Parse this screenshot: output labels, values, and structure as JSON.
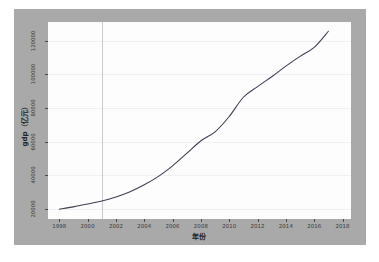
{
  "figure": {
    "background_color": "#a9a9a9",
    "plot_background_color": "#fdfdfd",
    "line_color": "#3d3d52",
    "grid_color": "#f0f0f2",
    "marker_line_color": "#c9c9cf",
    "caption": ""
  },
  "chart_data": {
    "type": "line",
    "title": "",
    "xlabel": "年份",
    "ylabel": "gdp（亿元）",
    "xlim": [
      1997.2,
      2018.6
    ],
    "ylim": [
      14000,
      131000
    ],
    "grid": true,
    "legend": null,
    "xticks": [
      1998,
      2000,
      2002,
      2004,
      2006,
      2008,
      2010,
      2012,
      2014,
      2016,
      2018
    ],
    "yticks": [
      20000,
      40000,
      60000,
      80000,
      100000,
      120000
    ],
    "annotations": [
      {
        "type": "vertical-line",
        "x": 2001,
        "label": ""
      }
    ],
    "x": [
      1998,
      1999,
      2000,
      2001,
      2002,
      2003,
      2004,
      2005,
      2006,
      2007,
      2008,
      2009,
      2010,
      2011,
      2012,
      2013,
      2014,
      2015,
      2016,
      2017
    ],
    "values": [
      19800,
      21200,
      22900,
      24700,
      27100,
      30200,
      34300,
      39300,
      45600,
      53000,
      60500,
      65800,
      74900,
      86300,
      92600,
      98500,
      104800,
      110600,
      115900,
      125500
    ],
    "series": [
      {
        "name": "gdp",
        "values": [
          19800,
          21200,
          22900,
          24700,
          27100,
          30200,
          34300,
          39300,
          45600,
          53000,
          60500,
          65800,
          74900,
          86300,
          92600,
          98500,
          104800,
          110600,
          115900,
          125500
        ]
      }
    ]
  },
  "axes": {
    "x_tick_labels": [
      "1998",
      "2000",
      "2002",
      "2004",
      "2006",
      "2008",
      "2010",
      "2012",
      "2014",
      "2016",
      "2018"
    ],
    "y_tick_labels": [
      "20000",
      "40000",
      "60000",
      "80000",
      "100000",
      "120000"
    ],
    "x_title": "年份",
    "y_title": "gdp（亿元）"
  }
}
